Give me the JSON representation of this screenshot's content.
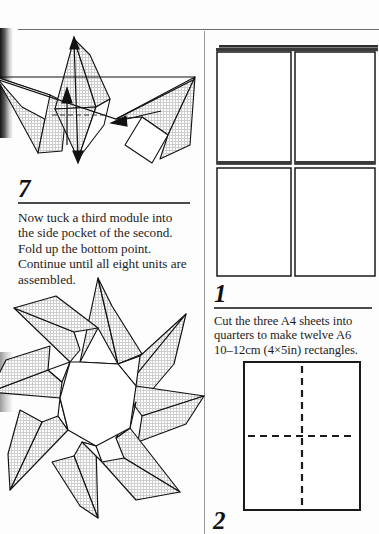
{
  "page": {
    "kind": "origami-instruction-book-page",
    "background_color": "#fdfdfd",
    "ink_color": "#1a1a1a",
    "shading_color": "#d9d9d9",
    "rule_color": "#6e6e6e"
  },
  "left_column": {
    "step": {
      "number": "7",
      "text": "Now tuck a third module into the side pocket of the second. Fold up the bottom point. Continue until all eight units are assembled."
    },
    "figures": [
      {
        "name": "three-assembled-modules",
        "description": "Three shaded origami modules joined in a row, with an upward fold arrow, a dashed fold line and a tuck arrow",
        "module_count": 3,
        "annotations": [
          "fold-up-arrow",
          "dashed-fold-line",
          "tuck-arrow"
        ]
      },
      {
        "name": "eight-pointed-star",
        "description": "Completed modular eight-pointed star with shaded units and a white octagonal centre",
        "points": 8,
        "units": 8
      }
    ]
  },
  "right_column": {
    "steps": [
      {
        "number": "1",
        "text": "Cut the three A4 sheets into quarters to make twelve A6 10–12cm (4×5in) rectangles.",
        "figure": {
          "name": "a4-sheets-cut-into-quarters",
          "description": "Stack of three A4 sheets shown cut into a 2 by 2 grid of four rectangles",
          "rows": 2,
          "columns": 2,
          "sheets_in_stack": 3
        }
      },
      {
        "number": "2",
        "text": "",
        "figure": {
          "name": "rectangle-with-crease-lines",
          "description": "Single A6 rectangle with dashed vertical and horizontal crease lines",
          "creases": [
            "vertical-dashed",
            "horizontal-dashed"
          ]
        }
      }
    ]
  },
  "measurements": {
    "paper_size_metric": "10–12cm",
    "paper_size_imperial": "4×5in",
    "sheet_format_source": "A4",
    "sheet_format_result": "A6",
    "pieces": "twelve"
  }
}
